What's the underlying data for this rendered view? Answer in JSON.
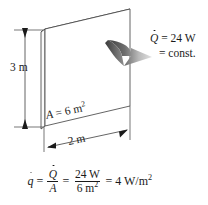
{
  "figure": {
    "background_color": "#ffffff",
    "line_color": "#1a1a1a",
    "arrow_dark_color": "#4a4a4a",
    "arrow_light_color": "#d8d8d8"
  },
  "labels": {
    "height": "3 m",
    "width": "2 m",
    "area": {
      "symbol": "A",
      "equals": "=",
      "value": "6 m",
      "exponent": "2"
    }
  },
  "callout": {
    "symbol": "Q",
    "equals": "=",
    "value": "24 W",
    "second_line": "= const."
  },
  "equation": {
    "flux_symbol": "q",
    "eq1": "=",
    "frac1": {
      "numerator": "Q",
      "denominator": "A"
    },
    "eq2": "=",
    "frac2": {
      "numerator": "24 W",
      "denominator_value": "6 m",
      "denominator_exponent": "2"
    },
    "eq3": "=",
    "result_value": "4 W/m",
    "result_exponent": "2"
  }
}
